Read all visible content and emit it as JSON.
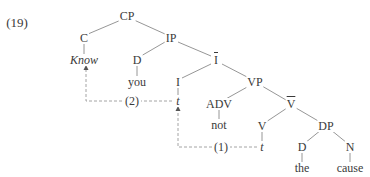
{
  "example_number": "(19)",
  "tree": {
    "nodes": {
      "cp": "CP",
      "c": "C",
      "know": "Know",
      "ip": "IP",
      "d_subject": "D",
      "you": "you",
      "i_bar": "I",
      "i": "I",
      "i_trace": "t",
      "vp": "VP",
      "adv": "ADV",
      "not": "not",
      "v_bar": "V",
      "v": "V",
      "v_trace": "t",
      "dp": "DP",
      "d_object": "D",
      "the": "the",
      "n": "N",
      "cause": "cause"
    },
    "movements": [
      {
        "label": "(1)",
        "from": "v_trace",
        "to": "i_trace"
      },
      {
        "label": "(2)",
        "from": "i_trace",
        "to": "know"
      }
    ]
  },
  "colors": {
    "ink": "#3a3a3a",
    "line": "#8a8a8a",
    "dashed": "#9a9a9a",
    "background": "#ffffff"
  }
}
